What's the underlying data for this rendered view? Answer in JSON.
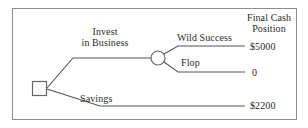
{
  "diagram": {
    "type": "decision-tree",
    "nodes": {
      "decision_node": "decision-square",
      "chance_node": "chance-circle"
    },
    "branches": {
      "invest": "Invest\nin Business",
      "invest_line1": "Invest",
      "invest_line2": "in Business",
      "wild_success": "Wild Success",
      "flop": "Flop",
      "savings": "Savings"
    },
    "outcomes": {
      "header_line1": "Final Cash",
      "header_line2": "Position",
      "wild_success_value": "$5000",
      "flop_value": "0",
      "savings_value": "$2200"
    },
    "colors": {
      "line": "#555555",
      "border": "#8d8d8d",
      "text": "#2b2b2b",
      "background": "#ffffff"
    }
  }
}
